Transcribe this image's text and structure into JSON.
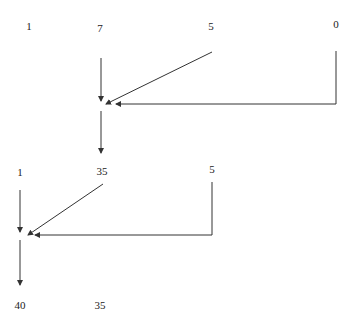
{
  "diagram": {
    "type": "dataflow-sum",
    "colors": {
      "line": "#333333",
      "text": "#222222",
      "background": "#ffffff"
    },
    "nodes": [
      {
        "id": "t1",
        "label": "1",
        "x": 29,
        "y": 30
      },
      {
        "id": "t2",
        "label": "7",
        "x": 100,
        "y": 32
      },
      {
        "id": "t3",
        "label": "5",
        "x": 211,
        "y": 30
      },
      {
        "id": "t4",
        "label": "0",
        "x": 336,
        "y": 28
      },
      {
        "id": "m1",
        "label": "1",
        "x": 20,
        "y": 176
      },
      {
        "id": "m2",
        "label": "35",
        "x": 102,
        "y": 175
      },
      {
        "id": "m3",
        "label": "5",
        "x": 212,
        "y": 173
      },
      {
        "id": "b1",
        "label": "40",
        "x": 20,
        "y": 309
      },
      {
        "id": "b2",
        "label": "35",
        "x": 100,
        "y": 309
      }
    ],
    "edges": [
      {
        "id": "e1",
        "d": "M101,58 L101,101",
        "arrow": true
      },
      {
        "id": "e2",
        "d": "M212,52 L106,104",
        "arrow": true
      },
      {
        "id": "e3",
        "d": "M336,51 L336,104 L116,104",
        "arrow": true
      },
      {
        "id": "e4",
        "d": "M101,111 L101,153",
        "arrow": true
      },
      {
        "id": "e5",
        "d": "M20,190 L20,232",
        "arrow": true
      },
      {
        "id": "e6",
        "d": "M103,184 L28,235",
        "arrow": true
      },
      {
        "id": "e7",
        "d": "M212,182 L212,235 L35,235",
        "arrow": true
      },
      {
        "id": "e8",
        "d": "M20,240 L20,285",
        "arrow": true
      }
    ]
  }
}
